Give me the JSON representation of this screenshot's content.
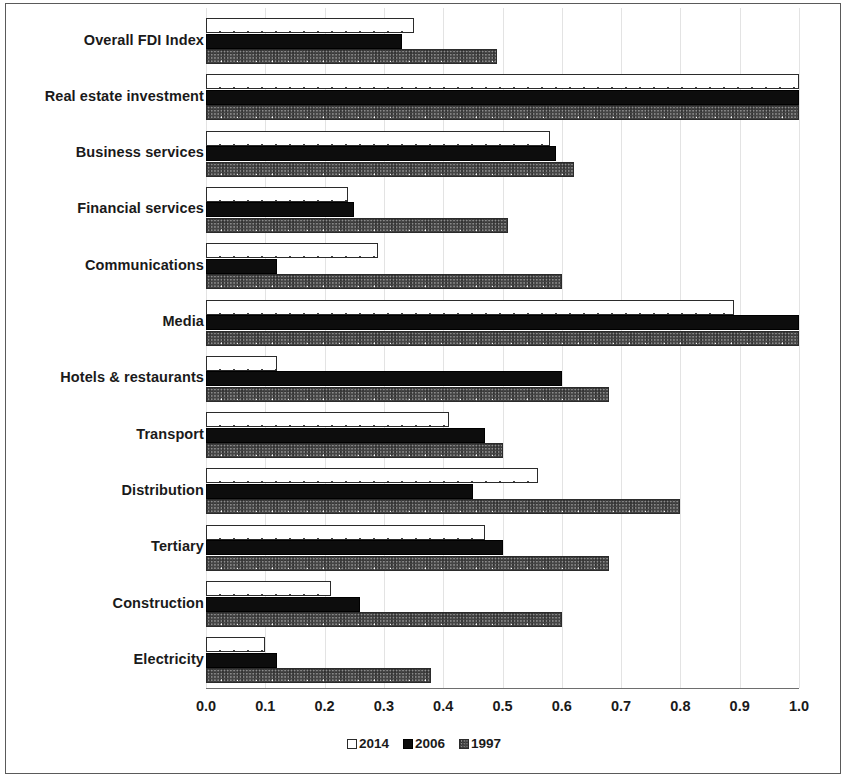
{
  "chart_data": {
    "type": "bar",
    "orientation": "horizontal",
    "title": "",
    "xlabel": "",
    "ylabel": "",
    "xlim": [
      0.0,
      1.0
    ],
    "xticks": [
      "0.0",
      "0.1",
      "0.2",
      "0.3",
      "0.4",
      "0.5",
      "0.6",
      "0.7",
      "0.8",
      "0.9",
      "1.0"
    ],
    "grid": true,
    "legend_position": "bottom",
    "categories": [
      "Overall FDI Index",
      "Real estate investment",
      "Business services",
      "Financial services",
      "Communications",
      "Media",
      "Hotels & restaurants",
      "Transport",
      "Distribution",
      "Tertiary",
      "Construction",
      "Electricity"
    ],
    "series": [
      {
        "name": "2014",
        "style": "open-white-dotted",
        "values": [
          0.35,
          1.0,
          0.58,
          0.24,
          0.29,
          0.89,
          0.12,
          0.41,
          0.56,
          0.47,
          0.21,
          0.1
        ]
      },
      {
        "name": "2006",
        "style": "solid-black",
        "values": [
          0.33,
          1.0,
          0.59,
          0.25,
          0.12,
          1.0,
          0.6,
          0.47,
          0.45,
          0.5,
          0.26,
          0.12
        ]
      },
      {
        "name": "1997",
        "style": "checkered-gray",
        "values": [
          0.49,
          1.0,
          0.62,
          0.51,
          0.6,
          1.0,
          0.68,
          0.5,
          0.8,
          0.68,
          0.6,
          0.38
        ]
      }
    ]
  },
  "legend": {
    "items": [
      {
        "label": "2014"
      },
      {
        "label": "2006"
      },
      {
        "label": "1997"
      }
    ]
  }
}
